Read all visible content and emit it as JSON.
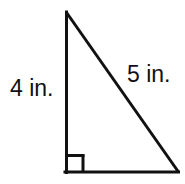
{
  "figure": {
    "name": "right-triangle",
    "background_color": "#ffffff",
    "stroke_color": "#111111",
    "stroke_width": 3,
    "width": 185,
    "height": 184,
    "vertices": {
      "apex": {
        "x": 66,
        "y": 12
      },
      "bottom_left": {
        "x": 66,
        "y": 172
      },
      "bottom_right": {
        "x": 178,
        "y": 172
      }
    },
    "right_angle_marker": {
      "name": "right-angle-square",
      "corner": "bottom-left",
      "size": 18,
      "x": 66,
      "y": 154
    },
    "labels": {
      "vertical_leg": "4 in.",
      "hypotenuse": "5 in.",
      "horizontal_leg": ""
    },
    "label_positions": {
      "vertical_leg": {
        "x": 10,
        "y": 77
      },
      "hypotenuse": {
        "x": 127,
        "y": 63
      }
    }
  }
}
